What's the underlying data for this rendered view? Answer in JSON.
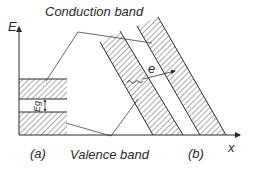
{
  "diagram": {
    "labels": {
      "conduction_band": "Conduction band",
      "valence_band": "Valence band",
      "energy_axis": "E",
      "position_axis": "x",
      "panel_a": "(a)",
      "panel_b": "(b)",
      "band_gap": "Eg",
      "electron": "e"
    },
    "colors": {
      "line": "#2a2a2a",
      "hatch": "#3a3a3a",
      "background": "#ffffff"
    }
  }
}
